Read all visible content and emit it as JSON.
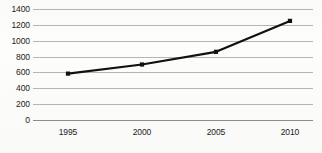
{
  "chart_data": {
    "type": "line",
    "title": "",
    "subtitle": "",
    "xlabel": "",
    "ylabel": "",
    "categories": [
      "1995",
      "2000",
      "2005",
      "2010"
    ],
    "x": [
      1995,
      2000,
      2005,
      2010
    ],
    "values": [
      585,
      700,
      860,
      1250
    ],
    "series": [
      {
        "name": "",
        "values": [
          585,
          700,
          860,
          1250
        ]
      }
    ],
    "xlim": [
      1993.5,
      2011.5
    ],
    "ylim": [
      0,
      1400
    ],
    "ytick_values": [
      0,
      200,
      400,
      600,
      800,
      1000,
      1200,
      1400
    ],
    "ytick_labels": [
      "0",
      "200",
      "400",
      "600",
      "800",
      "1000",
      "1200",
      "1400"
    ],
    "xtick_labels": [
      "1995",
      "2000",
      "2005",
      "2010"
    ],
    "grid": true,
    "grid_axis": "y",
    "legend": false,
    "legend_position": "none",
    "annotations": [],
    "colors": {
      "line": "#111111",
      "marker": "#111111",
      "grid": "#b4b4b4",
      "axis": "#8a8a8a",
      "background": "#fdfdfc",
      "text": "#1b1b1b"
    },
    "marker_style": "square",
    "line_width": 2.2
  }
}
